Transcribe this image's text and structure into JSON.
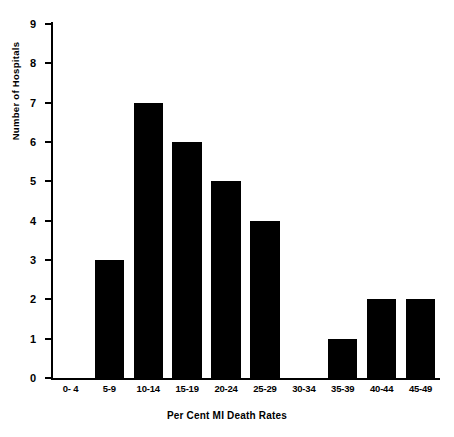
{
  "chart_data": {
    "type": "bar",
    "title": "",
    "xlabel": "Per Cent MI Death Rates",
    "ylabel": "Number of Hospitals",
    "categories": [
      "0- 4",
      "5-9",
      "10-14",
      "15-19",
      "20-24",
      "25-29",
      "30-34",
      "35-39",
      "40-44",
      "45-49"
    ],
    "values": [
      0,
      3,
      7,
      6,
      5,
      4,
      0,
      1,
      2,
      2
    ],
    "ylim": [
      0,
      9
    ],
    "ytick_labels": [
      "0",
      "1",
      "2",
      "3",
      "4",
      "5",
      "6",
      "7",
      "8",
      "9"
    ],
    "ytick_values": [
      0,
      1,
      2,
      3,
      4,
      5,
      6,
      7,
      8,
      9
    ],
    "grid": false,
    "legend": false,
    "bar_color": "#000000",
    "background_color": "#ffffff",
    "axis_color": "#000000"
  },
  "figure": {
    "top_strip_text": ""
  }
}
